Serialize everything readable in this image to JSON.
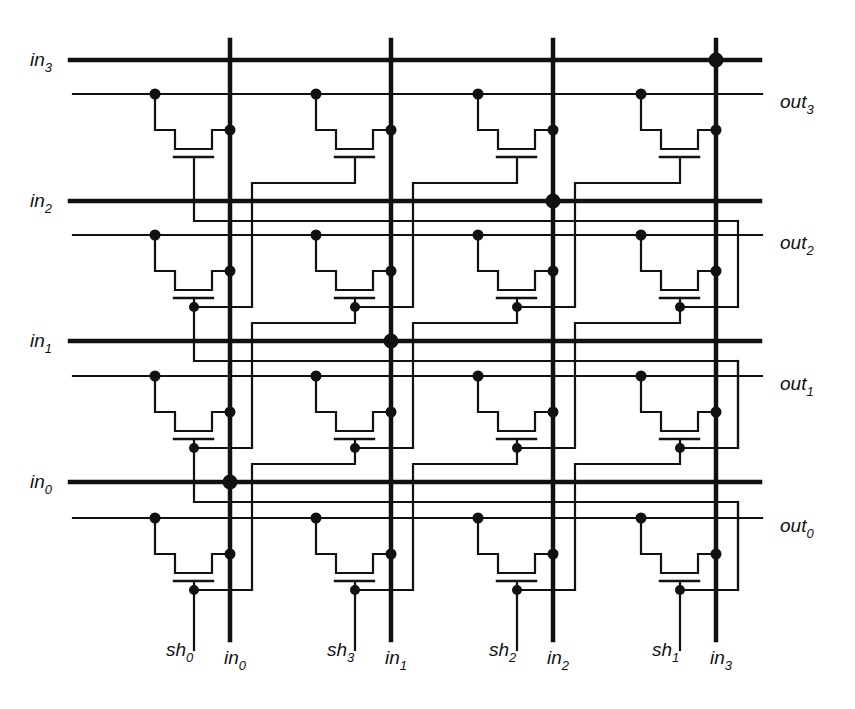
{
  "diagram": {
    "type": "barrel-shifter-crossbar",
    "colors": {
      "ink": "#111111",
      "background": "#ffffff"
    },
    "left_labels": [
      {
        "id": "in3",
        "base": "in",
        "sub": "3",
        "y": 60
      },
      {
        "id": "in2",
        "base": "in",
        "sub": "2",
        "y": 201
      },
      {
        "id": "in1",
        "base": "in",
        "sub": "1",
        "y": 341
      },
      {
        "id": "in0",
        "base": "in",
        "sub": "0",
        "y": 482
      }
    ],
    "right_labels": [
      {
        "id": "out3",
        "base": "out",
        "sub": "3",
        "y": 94
      },
      {
        "id": "out2",
        "base": "out",
        "sub": "2",
        "y": 235
      },
      {
        "id": "out1",
        "base": "out",
        "sub": "1",
        "y": 376
      },
      {
        "id": "out0",
        "base": "out",
        "sub": "0",
        "y": 518
      }
    ],
    "bottom_shift_labels": [
      {
        "id": "sh0",
        "base": "sh",
        "sub": "0",
        "x": 194
      },
      {
        "id": "sh3",
        "base": "sh",
        "sub": "3",
        "x": 355
      },
      {
        "id": "sh2",
        "base": "sh",
        "sub": "2",
        "x": 517
      },
      {
        "id": "sh1",
        "base": "sh",
        "sub": "1",
        "x": 680
      }
    ],
    "bottom_input_labels": [
      {
        "id": "in0b",
        "base": "in",
        "sub": "0",
        "x": 230
      },
      {
        "id": "in1b",
        "base": "in",
        "sub": "1",
        "x": 391
      },
      {
        "id": "in2b",
        "base": "in",
        "sub": "2",
        "x": 553
      },
      {
        "id": "in3b",
        "base": "in",
        "sub": "3",
        "x": 716
      }
    ],
    "columns_x": [
      230,
      391,
      553,
      716
    ],
    "rows": [
      {
        "in_y": 60,
        "out_y": 94
      },
      {
        "in_y": 201,
        "out_y": 235
      },
      {
        "in_y": 341,
        "out_y": 376
      },
      {
        "in_y": 482,
        "out_y": 518
      }
    ],
    "junctions": [
      {
        "x": 716,
        "y": 60
      },
      {
        "x": 553,
        "y": 201
      },
      {
        "x": 391,
        "y": 341
      },
      {
        "x": 230,
        "y": 482
      }
    ]
  }
}
